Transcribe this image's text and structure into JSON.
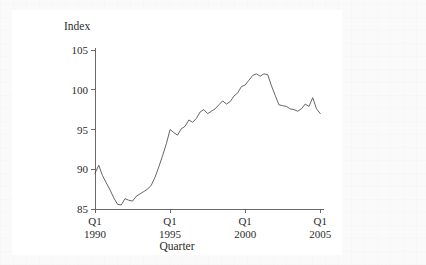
{
  "chart_data": {
    "type": "line",
    "title": "",
    "xlabel": "Quarter",
    "ylabel": "Index",
    "ylim": [
      85,
      105
    ],
    "yticks": [
      85,
      90,
      95,
      100,
      105
    ],
    "ytick_labels": [
      "85",
      "90",
      "95",
      "100",
      "105"
    ],
    "xlim": [
      1990.0,
      2005.25
    ],
    "xticks": [
      1990,
      1995,
      2000,
      2005
    ],
    "xtick_labels": [
      {
        "quarter": "Q1",
        "year": "1990"
      },
      {
        "quarter": "Q1",
        "year": "1995"
      },
      {
        "quarter": "Q1",
        "year": "2000"
      },
      {
        "quarter": "Q1",
        "year": "2005"
      }
    ],
    "grid": false,
    "legend": "none",
    "line_color": "#4a4a4a",
    "background_color": "#ffffff",
    "series": [
      {
        "name": "Index",
        "x": [
          1990.0,
          1990.25,
          1990.5,
          1990.75,
          1991.0,
          1991.25,
          1991.5,
          1991.75,
          1992.0,
          1992.25,
          1992.5,
          1992.75,
          1993.0,
          1993.25,
          1993.5,
          1993.75,
          1994.0,
          1994.25,
          1994.5,
          1994.75,
          1995.0,
          1995.25,
          1995.5,
          1995.75,
          1996.0,
          1996.25,
          1996.5,
          1996.75,
          1997.0,
          1997.25,
          1997.5,
          1997.75,
          1998.0,
          1998.25,
          1998.5,
          1998.75,
          1999.0,
          1999.25,
          1999.5,
          1999.75,
          2000.0,
          2000.25,
          2000.5,
          2000.75,
          2001.0,
          2001.25,
          2001.5,
          2001.75,
          2002.0,
          2002.25,
          2002.5,
          2002.75,
          2003.0,
          2003.25,
          2003.5,
          2003.75,
          2004.0,
          2004.25,
          2004.5,
          2004.75,
          2005.0
        ],
        "values": [
          89.5,
          90.5,
          89.2,
          88.3,
          87.4,
          86.4,
          85.6,
          85.5,
          86.3,
          86.1,
          86.0,
          86.6,
          86.9,
          87.2,
          87.5,
          88.0,
          89.0,
          90.3,
          91.7,
          93.2,
          95.0,
          94.6,
          94.3,
          95.1,
          95.4,
          96.2,
          95.9,
          96.4,
          97.2,
          97.5,
          97.0,
          97.3,
          97.6,
          98.1,
          98.6,
          98.2,
          98.5,
          99.2,
          99.6,
          100.4,
          100.6,
          101.2,
          101.8,
          102.0,
          101.7,
          102.0,
          101.9,
          100.5,
          99.3,
          98.1,
          98.0,
          97.9,
          97.6,
          97.5,
          97.3,
          97.6,
          98.2,
          97.9,
          99.0,
          97.6,
          97.0
        ]
      }
    ]
  },
  "labels": {
    "y_axis_title": "Index",
    "x_axis_title": "Quarter"
  }
}
